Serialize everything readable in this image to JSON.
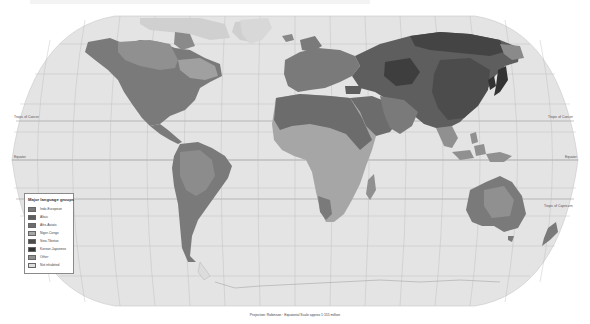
{
  "map": {
    "projection_caption": "Projection: Robinson · Equatorial Scale approx 1:155 million",
    "lines": {
      "tropic_of_cancer": "Tropic of Cancer",
      "equator": "Equator",
      "tropic_of_capricorn": "Tropic of Capricorn"
    },
    "colors": {
      "ocean": "#e4e4e4",
      "graticule": "#b4b4b4",
      "indo_european": "#7a7a7a",
      "altaic": "#5e5e5e",
      "afro_asiatic": "#6c6c6c",
      "niger_congo": "#a6a6a6",
      "sino_tibetan": "#4c4c4c",
      "korean_japanese": "#333333",
      "other": "#909090",
      "not_inhabited": "#dcdcdc"
    }
  },
  "legend": {
    "title": "Major language groups",
    "items": [
      {
        "label": "Indo-European",
        "color": "#7a7a7a"
      },
      {
        "label": "Altaic",
        "color": "#5e5e5e"
      },
      {
        "label": "Afro-Asiatic",
        "color": "#6c6c6c"
      },
      {
        "label": "Niger-Congo",
        "color": "#a6a6a6"
      },
      {
        "label": "Sino-Tibetan",
        "color": "#4c4c4c"
      },
      {
        "label": "Korean-Japanese",
        "color": "#333333"
      },
      {
        "label": "Other",
        "color": "#909090"
      },
      {
        "label": "Not inhabited",
        "color": "#dcdcdc"
      }
    ]
  }
}
